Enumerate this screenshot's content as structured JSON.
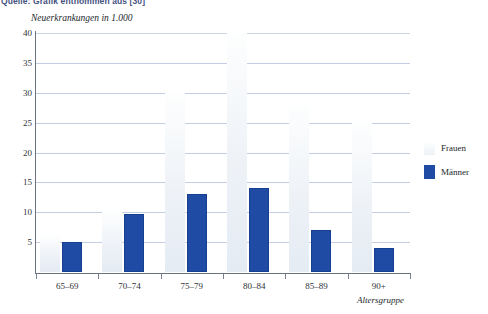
{
  "source_caption": "Quelle: Grafik entnommen aus [30]",
  "legend": {
    "position": "right",
    "entries": [
      {
        "label": "Frauen",
        "color": "#eef2f7",
        "swatch": "frauen-swatch"
      },
      {
        "label": "Männer",
        "color": "#1f4ba5",
        "swatch": "maenner-swatch"
      }
    ]
  },
  "chart_data": {
    "type": "bar",
    "title": "",
    "subtitle": "",
    "ylabel": "Neuerkrankungen in 1.000",
    "xlabel": "Altersgruppe",
    "categories": [
      "65–69",
      "70–74",
      "75–79",
      "80–84",
      "85–89",
      "90+"
    ],
    "series": [
      {
        "name": "Frauen",
        "color": "#eef2f7",
        "values": [
          6,
          10,
          30,
          40,
          28,
          25
        ]
      },
      {
        "name": "Männer",
        "color": "#1f4ba5",
        "values": [
          5,
          9.7,
          13,
          14,
          7,
          4
        ]
      }
    ],
    "ylim": [
      0,
      40
    ],
    "yticks": [
      5,
      10,
      15,
      20,
      25,
      30,
      35,
      40
    ],
    "ytick_labels": [
      "5",
      "10",
      "15",
      "20",
      "25",
      "30",
      "35",
      "40"
    ],
    "grid": "horizontal",
    "grid_color": "#b9c6dd",
    "legend_position": "right"
  }
}
